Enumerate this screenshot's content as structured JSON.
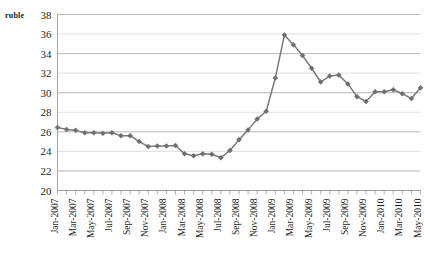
{
  "chart_data": {
    "type": "line",
    "title": "",
    "xlabel": "",
    "ylabel": "ruble",
    "ylim": [
      20,
      38
    ],
    "ytick_step": 2,
    "grid": true,
    "legend": "none",
    "series_color": "#7a7a7a",
    "marker": "diamond",
    "ytick_labels": [
      "38",
      "36",
      "34",
      "32",
      "30",
      "28",
      "26",
      "24",
      "22",
      "20"
    ],
    "ytick_values": [
      38,
      36,
      34,
      32,
      30,
      28,
      26,
      24,
      22,
      20
    ],
    "xtick_labels": [
      "Jan-2007",
      "Mar-2007",
      "May-2007",
      "Jul-2007",
      "Sep-2007",
      "Nov-2007",
      "Jan-2008",
      "Mar-2008",
      "May-2008",
      "Jul-2008",
      "Sep-2008",
      "Nov-2008",
      "Jan-2009",
      "Mar-2009",
      "May-2009",
      "Jul-2009",
      "Sep-2009",
      "Nov-2009",
      "Jan-2010",
      "Mar-2010",
      "May-2010"
    ],
    "x": [
      "Jan-2007",
      "Feb-2007",
      "Mar-2007",
      "Apr-2007",
      "May-2007",
      "Jun-2007",
      "Jul-2007",
      "Aug-2007",
      "Sep-2007",
      "Oct-2007",
      "Nov-2007",
      "Dec-2007",
      "Jan-2008",
      "Feb-2008",
      "Mar-2008",
      "Apr-2008",
      "May-2008",
      "Jun-2008",
      "Jul-2008",
      "Aug-2008",
      "Sep-2008",
      "Oct-2008",
      "Nov-2008",
      "Dec-2008",
      "Jan-2009",
      "Feb-2009",
      "Mar-2009",
      "Apr-2009",
      "May-2009",
      "Jun-2009",
      "Jul-2009",
      "Aug-2009",
      "Sep-2009",
      "Oct-2009",
      "Nov-2009",
      "Dec-2009",
      "Jan-2010",
      "Feb-2010",
      "Mar-2010",
      "Apr-2010",
      "May-2010"
    ],
    "values": [
      26.45,
      26.25,
      26.15,
      25.9,
      25.9,
      25.85,
      25.9,
      25.6,
      25.6,
      25.0,
      24.5,
      24.55,
      24.55,
      24.6,
      23.75,
      23.55,
      23.75,
      23.7,
      23.35,
      24.1,
      25.2,
      26.2,
      27.3,
      28.1,
      31.5,
      35.9,
      34.9,
      33.8,
      32.5,
      31.1,
      31.7,
      31.8,
      30.9,
      29.6,
      29.1,
      30.1,
      30.1,
      30.3,
      29.9,
      29.4,
      30.5
    ]
  }
}
